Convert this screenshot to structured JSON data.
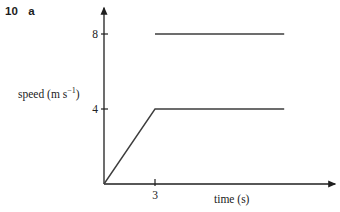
{
  "header": {
    "question_number": "10",
    "part_label": "a"
  },
  "chart_data": {
    "type": "line",
    "xlabel": "time (s)",
    "ylabel": {
      "full": "speed (m s⁻¹)",
      "base": "speed (m s",
      "sup": "−1",
      "close": ")"
    },
    "xlim": [
      0,
      13.6
    ],
    "ylim": [
      0,
      9.4
    ],
    "grid": false,
    "legend": "none",
    "x_ticks": [
      {
        "value": 3,
        "label": "3"
      }
    ],
    "y_ticks": [
      {
        "value": 4,
        "label": "4"
      },
      {
        "value": 8,
        "label": "8"
      }
    ],
    "series": [
      {
        "name": "upper-constant-speed-line",
        "points": [
          [
            3,
            8
          ],
          [
            10.6,
            8
          ]
        ]
      },
      {
        "name": "accelerate-then-constant-line",
        "points": [
          [
            0,
            0
          ],
          [
            3,
            4
          ],
          [
            10.6,
            4
          ]
        ]
      }
    ],
    "colors": {
      "axis": "#1f1f1f",
      "line": "#3d3d3d",
      "text": "#222222",
      "background": "#ffffff"
    }
  }
}
